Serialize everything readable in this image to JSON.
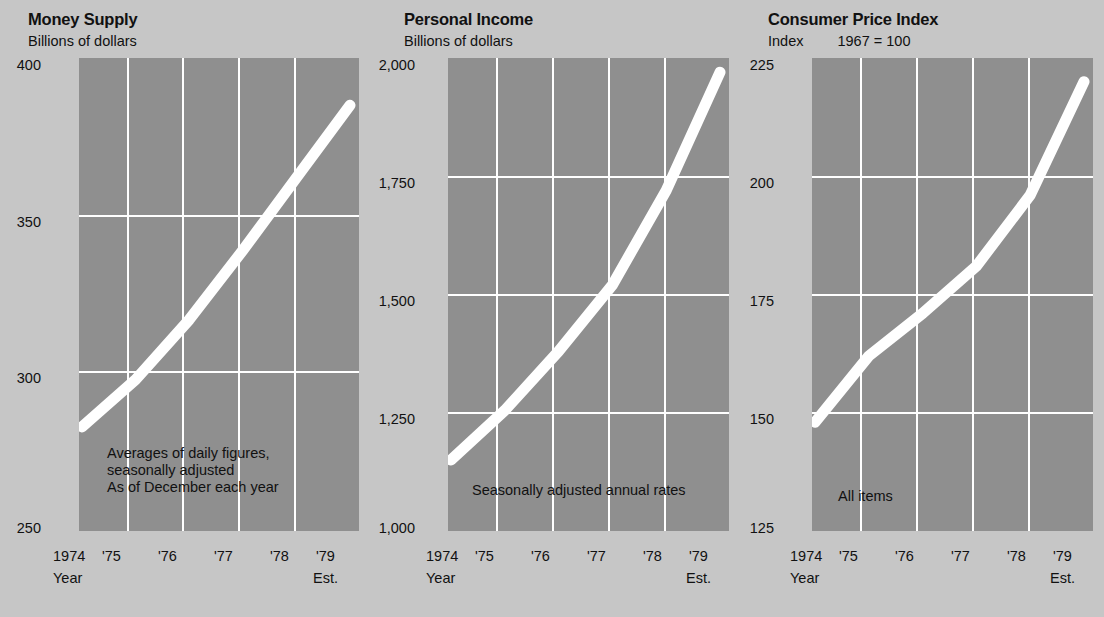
{
  "colors": {
    "page_background": "#c6c6c6",
    "plot_background": "#8f8f8f",
    "grid": "#ffffff",
    "series": "#ffffff",
    "text": "#111111"
  },
  "charts": [
    {
      "title": "Money Supply",
      "unit_label": "Billions of dollars",
      "unit_base": "",
      "annotation": "Averages of daily figures,\nseasonally adjusted\nAs of December each year",
      "x_axis_caption": "Year",
      "x_axis_est": "Est.",
      "y_ticks": [
        "400",
        "350",
        "300",
        "250"
      ],
      "x_ticks": [
        "1974",
        "'75",
        "'76",
        "'77",
        "'78",
        "'79"
      ],
      "chart_data": {
        "type": "line",
        "title": "Money Supply",
        "xlabel": "Year",
        "ylabel": "Billions of dollars",
        "ylim": [
          250,
          400
        ],
        "yticks": [
          250,
          300,
          350,
          400
        ],
        "grid": true,
        "legend": "none",
        "x": [
          1974,
          1975,
          1976,
          1977,
          1978,
          1979
        ],
        "xticklabels": [
          "1974",
          "'75",
          "'76",
          "'77",
          "'78",
          "'79"
        ],
        "values": [
          283,
          298,
          317,
          339,
          362,
          385
        ],
        "annotation": "Averages of daily figures, seasonally adjusted. As of December each year",
        "note": "1979 value is an estimate"
      }
    },
    {
      "title": "Personal Income",
      "unit_label": "Billions of dollars",
      "unit_base": "",
      "annotation": "Seasonally adjusted annual rates",
      "x_axis_caption": "Year",
      "x_axis_est": "Est.",
      "y_ticks": [
        "2,000",
        "1,750",
        "1,500",
        "1,250",
        "1,000"
      ],
      "x_ticks": [
        "1974",
        "'75",
        "'76",
        "'77",
        "'78",
        "'79"
      ],
      "chart_data": {
        "type": "line",
        "title": "Personal Income",
        "xlabel": "Year",
        "ylabel": "Billions of dollars",
        "ylim": [
          1000,
          2000
        ],
        "yticks": [
          1000,
          1250,
          1500,
          1750,
          2000
        ],
        "grid": true,
        "legend": "none",
        "x": [
          1974,
          1975,
          1976,
          1977,
          1978,
          1979
        ],
        "xticklabels": [
          "1974",
          "'75",
          "'76",
          "'77",
          "'78",
          "'79"
        ],
        "values": [
          1150,
          1255,
          1380,
          1520,
          1720,
          1970
        ],
        "annotation": "Seasonally adjusted annual rates",
        "note": "1979 value is an estimate"
      }
    },
    {
      "title": "Consumer Price Index",
      "unit_label": "Index",
      "unit_base": "1967 = 100",
      "annotation": "All items",
      "x_axis_caption": "Year",
      "x_axis_est": "Est.",
      "y_ticks": [
        "225",
        "200",
        "175",
        "150",
        "125"
      ],
      "x_ticks": [
        "1974",
        "'75",
        "'76",
        "'77",
        "'78",
        "'79"
      ],
      "chart_data": {
        "type": "line",
        "title": "Consumer Price Index",
        "xlabel": "Year",
        "ylabel": "Index",
        "base_note": "1967 = 100",
        "ylim": [
          125,
          225
        ],
        "yticks": [
          125,
          150,
          175,
          200,
          225
        ],
        "grid": true,
        "legend": "none",
        "x": [
          1974,
          1975,
          1976,
          1977,
          1978,
          1979
        ],
        "xticklabels": [
          "1974",
          "'75",
          "'76",
          "'77",
          "'78",
          "'79"
        ],
        "values": [
          148,
          162,
          171,
          181,
          196,
          220
        ],
        "annotation": "All items",
        "note": "1979 value is an estimate"
      }
    }
  ]
}
